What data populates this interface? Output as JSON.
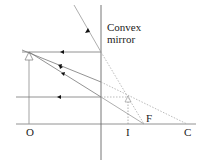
{
  "labels": {
    "mirror_line1": "Convex",
    "mirror_line2": "mirror",
    "object_point": "O",
    "image_point": "I",
    "focus_point": "F",
    "center_point": "C"
  },
  "colors": {
    "line": "#777777",
    "dark_line": "#555555",
    "text": "#222222",
    "arrow": "#111111"
  }
}
